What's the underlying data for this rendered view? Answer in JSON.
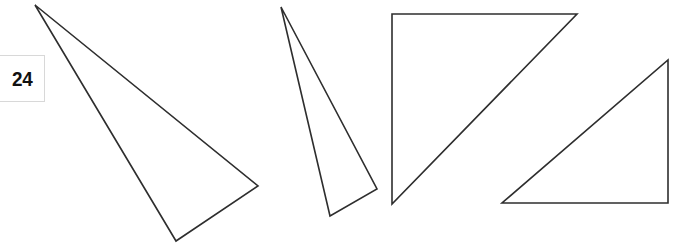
{
  "page": {
    "page_number": "24"
  },
  "figures": {
    "stroke_color": "#2e2e2e",
    "triangles": [
      {
        "name": "obtuse-triangle",
        "points": "35,5 258,186 176,241"
      },
      {
        "name": "acute-narrow-triangle",
        "points": "281,7 377,189 330,216"
      },
      {
        "name": "right-triangle-top-left",
        "points": "392,14 577,14 392,204"
      },
      {
        "name": "right-triangle-bottom-right",
        "points": "668,60 668,203 502,203"
      }
    ]
  }
}
